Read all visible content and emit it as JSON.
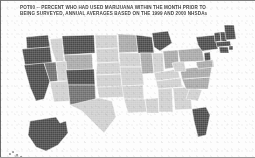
{
  "figure": {
    "caption_line_1": "POT00 -- PERCENT WHO HAD USED MARIJUANA WITHIN THE MONTH PRIOR TO",
    "caption_line_2": "BEING SURVEYED, ANNUAL AVERAGES BASED ON THE 1999 AND 2000 NHSDAs",
    "variable_code": "POT00",
    "background_color": "#ffffff",
    "text_color": "#2b2b2b"
  },
  "chart_data": {
    "type": "heatmap",
    "title": "POT00 -- PERCENT WHO HAD USED MARIJUANA WITHIN THE MONTH PRIOR TO BEING SURVEYED, ANNUAL AVERAGES BASED ON THE 1999 AND 2000 NHSDAs",
    "subtitle": "",
    "xlabel": "",
    "ylabel": "",
    "legend": [],
    "legend_position": "none",
    "grid": false,
    "projection": "united-states-choropleth",
    "shade_scale": [
      {
        "level": "very-light",
        "color": "#e6e6e6"
      },
      {
        "level": "light",
        "color": "#cfcfcf"
      },
      {
        "level": "medium",
        "color": "#a8a8a8"
      },
      {
        "level": "dark",
        "color": "#6f6f6f"
      },
      {
        "level": "very-dark",
        "color": "#4a4a4a"
      }
    ],
    "categories": [
      "WA",
      "OR",
      "CA",
      "NV",
      "ID",
      "MT",
      "WY",
      "UT",
      "AZ",
      "CO",
      "NM",
      "ND",
      "SD",
      "NE",
      "KS",
      "OK",
      "TX",
      "MN",
      "IA",
      "MO",
      "AR",
      "LA",
      "WI",
      "IL",
      "MI",
      "IN",
      "OH",
      "KY",
      "TN",
      "MS",
      "AL",
      "GA",
      "FL",
      "SC",
      "NC",
      "VA",
      "WV",
      "PA",
      "NY",
      "VT",
      "NH",
      "ME",
      "MA",
      "RI",
      "CT",
      "NJ",
      "DE",
      "MD",
      "AK",
      "HI"
    ],
    "values": [
      "very-dark",
      "very-dark",
      "very-dark",
      "dark",
      "light",
      "very-dark",
      "medium",
      "light",
      "light",
      "very-dark",
      "dark",
      "light",
      "light",
      "light",
      "light",
      "light",
      "light",
      "medium",
      "light",
      "light",
      "light",
      "light",
      "very-dark",
      "medium",
      "very-dark",
      "light",
      "medium",
      "light",
      "light",
      "light",
      "light",
      "light",
      "very-dark",
      "light",
      "medium",
      "medium",
      "light",
      "medium",
      "very-dark",
      "very-dark",
      "very-dark",
      "very-dark",
      "very-dark",
      "very-dark",
      "very-dark",
      "very-dark",
      "medium",
      "medium",
      "very-dark",
      "light"
    ]
  }
}
